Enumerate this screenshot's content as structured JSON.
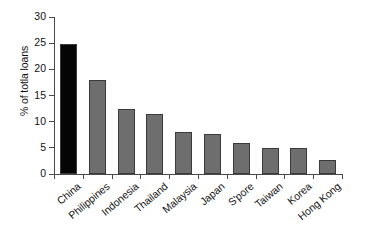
{
  "chart_data": {
    "type": "bar",
    "title": "",
    "subtitle": "",
    "xlabel": "",
    "ylabel": "% of totla loans",
    "categories": [
      "China",
      "Philippines",
      "Indonesia",
      "Thailand",
      "Malaysia",
      "Japan",
      "S'pore",
      "Taiwan",
      "Korea",
      "Hong Kong"
    ],
    "values": [
      24.9,
      18.0,
      12.5,
      11.4,
      8.0,
      7.6,
      6.0,
      5.0,
      5.0,
      2.6
    ],
    "ylim": [
      0,
      30
    ],
    "ytick_labels": [
      "0",
      "5",
      "10",
      "15",
      "20",
      "25",
      "30"
    ],
    "ytick_values": [
      0,
      5,
      10,
      15,
      20,
      25,
      30
    ],
    "grid": false,
    "legend": "none",
    "bar_colors": [
      "#050505",
      "#6e6e6e",
      "#6e6e6e",
      "#6e6e6e",
      "#6e6e6e",
      "#6e6e6e",
      "#6e6e6e",
      "#6e6e6e",
      "#6e6e6e",
      "#6e6e6e"
    ],
    "bar_border_color": "#3a3a3a",
    "highlight_category": "China",
    "highlight_color": "#050505",
    "series_color": "#6e6e6e",
    "axis_color": "#4a4a4a",
    "background_color": "#ffffff"
  }
}
